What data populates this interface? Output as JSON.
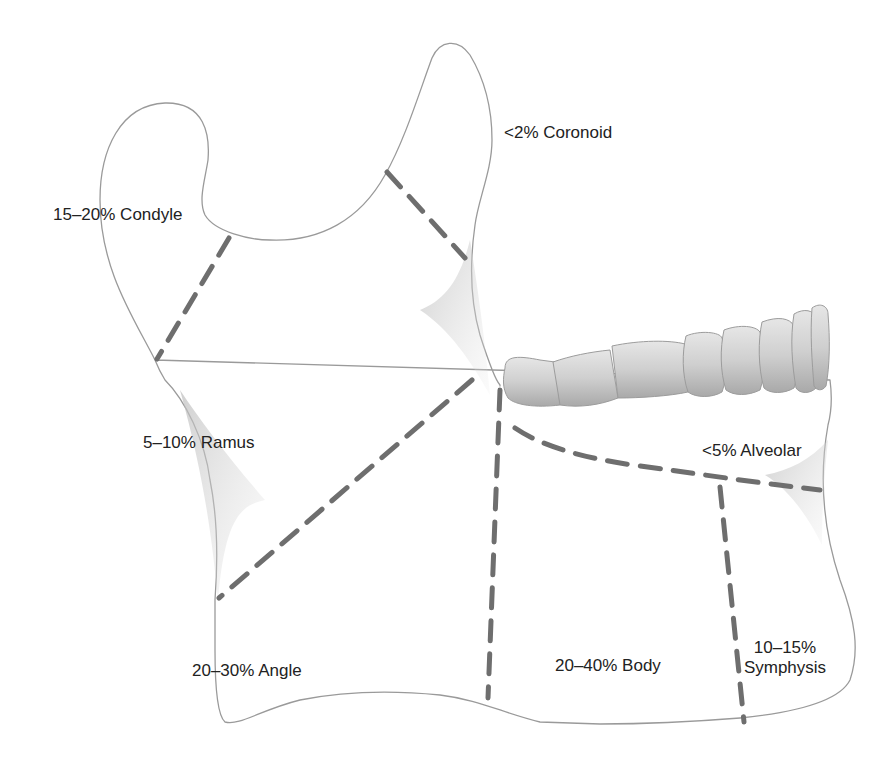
{
  "figure": {
    "regions": [
      {
        "id": "coronoid",
        "label": "<2% Coronoid"
      },
      {
        "id": "condyle",
        "label": "15–20% Condyle"
      },
      {
        "id": "ramus",
        "label": "5–10% Ramus"
      },
      {
        "id": "alveolar",
        "label": "<5% Alveolar"
      },
      {
        "id": "angle",
        "label": "20–30% Angle"
      },
      {
        "id": "body",
        "label": "20–40% Body"
      },
      {
        "id": "symphysis",
        "label_line1": "10–15%",
        "label_line2": "Symphysis"
      }
    ],
    "colors": {
      "outline": "#9a9a9a",
      "fracture_line": "#6e6e6e",
      "text": "#222222",
      "teeth": "#c8c8c8"
    }
  }
}
